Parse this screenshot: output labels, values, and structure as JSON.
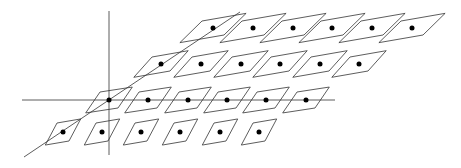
{
  "diagram": {
    "colors": {
      "stroke": "#333333",
      "dot": "#000000",
      "background": "#ffffff"
    },
    "axes": {
      "vertical": {
        "x1": 109,
        "y1": 11,
        "x2": 109,
        "y2": 155
      },
      "horizontal": {
        "x1": 22,
        "y1": 100,
        "x2": 335,
        "y2": 100
      },
      "diagonal": {
        "x1": 24,
        "y1": 157,
        "x2": 240,
        "y2": 12
      }
    },
    "rows": [
      {
        "name": "row-1",
        "y": 28,
        "halfw": 28,
        "halfh": 7,
        "skew": 17,
        "xs": [
          213,
          253,
          293,
          332,
          372,
          412
        ]
      },
      {
        "name": "row-2",
        "y": 64,
        "halfw": 23,
        "halfh": 7,
        "skew": 14,
        "xs": [
          161,
          201,
          241,
          280,
          320,
          359
        ]
      },
      {
        "name": "row-3",
        "y": 100,
        "halfw": 20,
        "halfh": 8,
        "skew": 11,
        "xs": [
          109,
          148,
          188,
          227,
          266,
          306
        ]
      },
      {
        "name": "row-4",
        "y": 132,
        "halfw": 15,
        "halfh": 9,
        "skew": 9,
        "xs": [
          63,
          102,
          141,
          180,
          220,
          259
        ]
      }
    ],
    "dot_radius": 2.5
  }
}
